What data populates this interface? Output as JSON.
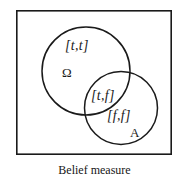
{
  "figure": {
    "caption": "Belief measure",
    "frame": {
      "x": 16,
      "y": 10,
      "width": 156,
      "height": 145,
      "stroke": "#1a1a1a",
      "fill": "#ffffff",
      "stroke_width": 1.6
    },
    "regions": [
      {
        "id": "omega-circle",
        "set_label": "Ω",
        "value_label": "[t,t]",
        "cx": 86,
        "cy": 71,
        "r": 44,
        "stroke": "#1a1a1a"
      },
      {
        "id": "a-circle",
        "set_label": "A",
        "value_label": "[f,f]",
        "cx": 121,
        "cy": 108,
        "r": 36.5,
        "stroke": "#1a1a1a"
      }
    ],
    "intersection": {
      "id": "omega-a-intersection",
      "value_label": "[t,f]"
    },
    "labels": {
      "tt": "[t,t]",
      "omega": "Ω",
      "tf": "[t,f]",
      "ff": "[f,f]",
      "a": "A"
    }
  },
  "chart_data": {
    "type": "diagram",
    "subtype": "venn",
    "title": "Belief measure",
    "sets": [
      {
        "name": "Ω",
        "label": "Ω",
        "region_value": "[t,t]"
      },
      {
        "name": "A",
        "label": "A",
        "region_value": "[f,f]"
      }
    ],
    "overlap_value": "[t,f]",
    "annotations": [
      "[t,t]",
      "Ω",
      "[t,f]",
      "[f,f]",
      "A"
    ],
    "legend": "none",
    "grid": false
  }
}
